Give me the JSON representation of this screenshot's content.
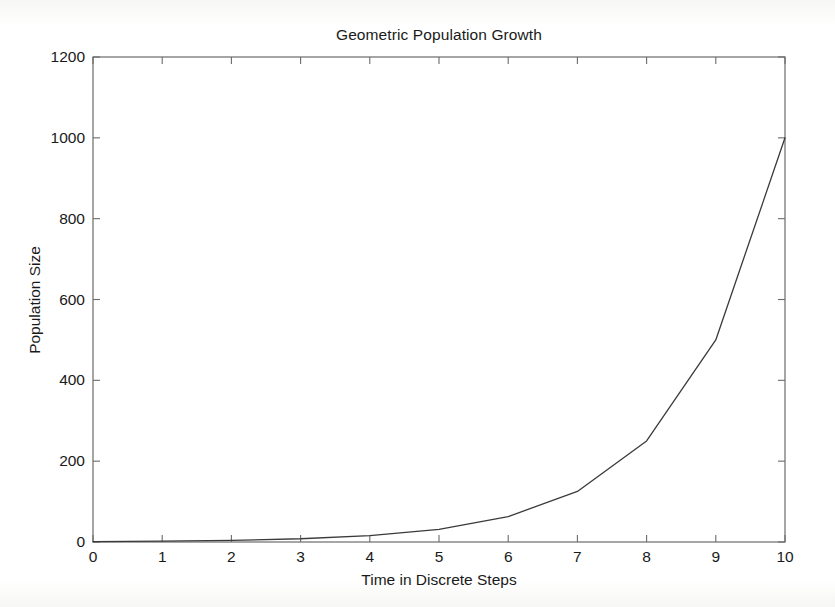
{
  "chart_data": {
    "type": "line",
    "title": "Geometric Population Growth",
    "xlabel": "Time in Discrete Steps",
    "ylabel": "Population Size",
    "x": [
      0,
      1,
      2,
      3,
      4,
      5,
      6,
      7,
      8,
      9,
      10
    ],
    "values": [
      1,
      2,
      4,
      8,
      16,
      31,
      63,
      125,
      250,
      500,
      1000
    ],
    "series": [
      {
        "name": "Population Size",
        "values": [
          1,
          2,
          4,
          8,
          16,
          31,
          63,
          125,
          250,
          500,
          1000
        ]
      }
    ],
    "xlim": [
      0,
      10
    ],
    "ylim": [
      0,
      1200
    ],
    "xticks": [
      "0",
      "1",
      "2",
      "3",
      "4",
      "5",
      "6",
      "7",
      "8",
      "9",
      "10"
    ],
    "yticks": [
      "0",
      "200",
      "400",
      "600",
      "800",
      "1000",
      "1200"
    ],
    "xtick_values": [
      0,
      1,
      2,
      3,
      4,
      5,
      6,
      7,
      8,
      9,
      10
    ],
    "ytick_values": [
      0,
      200,
      400,
      600,
      800,
      1000,
      1200
    ],
    "grid": false,
    "legend": false,
    "legend_position": "none",
    "line_color": "#3a3a3a",
    "axis_color": "#555555",
    "background_color": "#ffffff"
  }
}
